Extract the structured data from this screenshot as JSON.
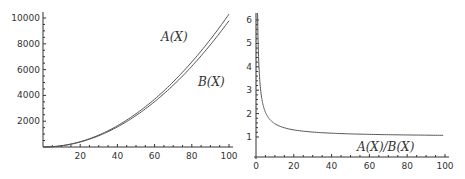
{
  "chart_data": [
    {
      "type": "line",
      "title": "",
      "xlabel": "",
      "ylabel": "",
      "xlim": [
        0,
        100
      ],
      "ylim": [
        0,
        10000
      ],
      "grid": false,
      "x_ticks": [
        "20",
        "40",
        "60",
        "80",
        "100"
      ],
      "y_ticks": [
        "2000",
        "4000",
        "6000",
        "8000",
        "10000"
      ],
      "x": [
        0,
        10,
        20,
        30,
        40,
        50,
        60,
        70,
        80,
        90,
        100
      ],
      "series": [
        {
          "name": "A(X)",
          "values": [
            0,
            100,
            420,
            950,
            1680,
            2620,
            3760,
            5100,
            6640,
            8380,
            10300
          ]
        },
        {
          "name": "B(X)",
          "values": [
            0,
            60,
            350,
            850,
            1560,
            2460,
            3580,
            4880,
            6380,
            8080,
            9800
          ]
        }
      ],
      "annotations": [
        {
          "text": "A(X)",
          "x": 72,
          "y": 8600
        },
        {
          "text": "B(X)",
          "x": 92,
          "y": 6200
        }
      ]
    },
    {
      "type": "line",
      "title": "",
      "xlabel": "",
      "ylabel": "",
      "xlim": [
        0,
        100
      ],
      "ylim": [
        0.8,
        6.2
      ],
      "grid": false,
      "x_ticks": [
        "0",
        "20",
        "40",
        "60",
        "80",
        "100"
      ],
      "y_ticks": [
        "1",
        "2",
        "3",
        "4",
        "5",
        "6"
      ],
      "x": [
        0.8,
        1,
        2,
        3,
        5,
        8,
        10,
        15,
        20,
        30,
        40,
        60,
        80,
        100
      ],
      "series": [
        {
          "name": "A(X)/B(X)",
          "values": [
            6.2,
            5.5,
            3.4,
            2.7,
            2.0,
            1.7,
            1.57,
            1.4,
            1.3,
            1.21,
            1.16,
            1.11,
            1.09,
            1.07
          ]
        }
      ],
      "annotations": [
        {
          "text": "A(X)/B(X)",
          "x": 70,
          "y": 0.9
        }
      ]
    }
  ],
  "labels": {
    "left": {
      "a": "A(X)",
      "b": "B(X)",
      "x_ticks": [
        "20",
        "40",
        "60",
        "80",
        "100"
      ],
      "y_ticks": [
        "2000",
        "4000",
        "6000",
        "8000",
        "10000"
      ]
    },
    "right": {
      "ratio": "A(X)/B(X)",
      "x_ticks": [
        "0",
        "20",
        "40",
        "60",
        "80",
        "100"
      ],
      "y_ticks": [
        "1",
        "2",
        "3",
        "4",
        "5",
        "6"
      ]
    }
  }
}
